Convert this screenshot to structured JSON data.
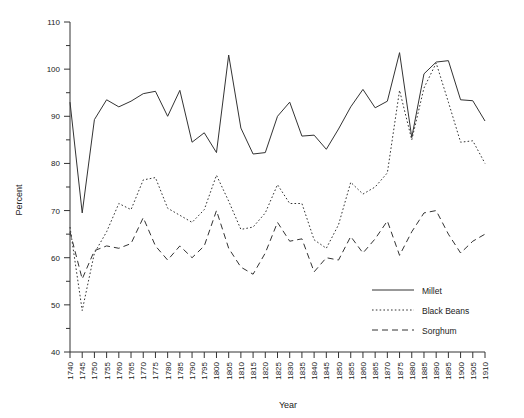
{
  "chart_data": {
    "type": "line",
    "title": "",
    "xlabel": "Year",
    "ylabel": "Percent",
    "xlim": [
      1740,
      1910
    ],
    "ylim": [
      40,
      110
    ],
    "grid": false,
    "legend_position": "bottom-right",
    "y_ticks_major": [
      40,
      50,
      60,
      70,
      80,
      90,
      100,
      110
    ],
    "y_ticks_minor": [
      45,
      55,
      65,
      75,
      85,
      95,
      105
    ],
    "x": [
      1740,
      1745,
      1750,
      1755,
      1760,
      1765,
      1770,
      1775,
      1780,
      1785,
      1790,
      1795,
      1800,
      1805,
      1810,
      1815,
      1820,
      1825,
      1830,
      1835,
      1840,
      1845,
      1850,
      1855,
      1860,
      1865,
      1870,
      1875,
      1880,
      1885,
      1890,
      1895,
      1900,
      1905,
      1910
    ],
    "x_tick_labels": [
      "1740",
      "1745",
      "1750",
      "1755",
      "1760",
      "1765",
      "1770",
      "1775",
      "1780",
      "1785",
      "1790",
      "1795",
      "1800",
      "1805",
      "1810",
      "1815",
      "1820",
      "1825",
      "1830",
      "1835",
      "1840",
      "1845",
      "1850",
      "1855",
      "1860",
      "1865",
      "1870",
      "1875",
      "1880",
      "1885",
      "1890",
      "1895",
      "1900",
      "1905",
      "1910"
    ],
    "series": [
      {
        "name": "Millet",
        "style": "solid",
        "color": "#333333",
        "values": [
          93.0,
          69.5,
          89.3,
          93.5,
          92.0,
          93.2,
          94.8,
          95.3,
          90.0,
          95.5,
          84.5,
          86.5,
          82.3,
          103.0,
          87.5,
          82.0,
          82.3,
          90.0,
          93.0,
          85.8,
          86.0,
          83.0,
          87.3,
          92.0,
          95.7,
          91.8,
          93.2,
          103.5,
          85.5,
          99.0,
          101.5,
          101.8,
          93.5,
          93.3,
          89.0
        ]
      },
      {
        "name": "Black Beans",
        "style": "dotted",
        "color": "#333333",
        "values": [
          66.5,
          48.8,
          61.0,
          65.5,
          71.5,
          70.2,
          76.5,
          77.0,
          70.5,
          69.0,
          67.5,
          70.2,
          77.5,
          72.0,
          66.0,
          66.5,
          69.5,
          75.5,
          71.5,
          71.5,
          63.8,
          62.0,
          67.0,
          76.0,
          73.5,
          75.0,
          78.0,
          95.5,
          85.0,
          96.0,
          101.3,
          93.0,
          84.5,
          84.8,
          80.0
        ]
      },
      {
        "name": "Sorghum",
        "style": "dashed",
        "color": "#333333",
        "values": [
          65.5,
          55.5,
          61.5,
          62.5,
          62.0,
          63.0,
          68.5,
          62.5,
          59.5,
          62.5,
          60.0,
          62.5,
          70.0,
          62.0,
          58.0,
          56.5,
          61.0,
          67.5,
          63.5,
          64.0,
          57.0,
          60.0,
          59.5,
          64.5,
          61.0,
          64.0,
          67.8,
          60.5,
          65.5,
          69.5,
          70.0,
          65.0,
          61.0,
          63.5,
          65.0
        ]
      }
    ]
  },
  "legend": {
    "items": [
      {
        "label": "Millet",
        "style": "solid"
      },
      {
        "label": "Black Beans",
        "style": "dotted"
      },
      {
        "label": "Sorghum",
        "style": "dashed"
      }
    ]
  }
}
